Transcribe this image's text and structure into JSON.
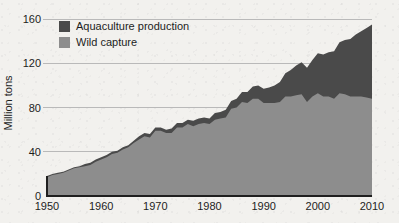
{
  "figure": {
    "background_color": "#f2f1ee",
    "plot_left_px": 47,
    "plot_right_px": 372,
    "plot_top_px": 8,
    "plot_baseline_px": 196
  },
  "legend": {
    "position": "top-left-inside",
    "entries": [
      {
        "label": "Aquaculture production",
        "color": "#4a4a4a"
      },
      {
        "label": "Wild capture",
        "color": "#8d8d8d"
      }
    ]
  },
  "axes": {
    "y_title": "Million tons",
    "y_ticks": [
      "0",
      "40",
      "80",
      "120",
      "160"
    ],
    "x_ticks": [
      "1950",
      "1960",
      "1970",
      "1980",
      "1990",
      "2000",
      "2010"
    ]
  },
  "chart_data": {
    "type": "area",
    "stacked": true,
    "title": "",
    "xlabel": "",
    "ylabel": "Million tons",
    "xlim": [
      1950,
      2010
    ],
    "ylim": [
      0,
      170
    ],
    "yticks": [
      0,
      40,
      80,
      120,
      160
    ],
    "xticks": [
      1950,
      1960,
      1970,
      1980,
      1990,
      2000,
      2010
    ],
    "grid": "horizontal",
    "legend_position": "upper left",
    "x": [
      1950,
      1951,
      1952,
      1953,
      1954,
      1955,
      1956,
      1957,
      1958,
      1959,
      1960,
      1961,
      1962,
      1963,
      1964,
      1965,
      1966,
      1967,
      1968,
      1969,
      1970,
      1971,
      1972,
      1973,
      1974,
      1975,
      1976,
      1977,
      1978,
      1979,
      1980,
      1981,
      1982,
      1983,
      1984,
      1985,
      1986,
      1987,
      1988,
      1989,
      1990,
      1991,
      1992,
      1993,
      1994,
      1995,
      1996,
      1997,
      1998,
      1999,
      2000,
      2001,
      2002,
      2003,
      2004,
      2005,
      2006,
      2007,
      2008,
      2009,
      2010
    ],
    "series": [
      {
        "name": "Wild capture",
        "color": "#8d8d8d",
        "values": [
          17,
          19,
          20,
          21,
          23,
          25,
          26,
          27,
          28,
          31,
          33,
          35,
          38,
          39,
          42,
          44,
          48,
          51,
          54,
          53,
          59,
          59,
          57,
          57,
          62,
          62,
          65,
          63,
          65,
          66,
          65,
          69,
          70,
          71,
          79,
          80,
          85,
          84,
          88,
          88,
          84,
          84,
          84,
          85,
          90,
          90,
          91,
          92,
          85,
          90,
          93,
          90,
          90,
          88,
          93,
          92,
          90,
          90,
          90,
          89,
          88
        ]
      },
      {
        "name": "Aquaculture production",
        "color": "#4a4a4a",
        "values": [
          1,
          1,
          1,
          1,
          1,
          1,
          1,
          2,
          2,
          2,
          2,
          2,
          2,
          2,
          2,
          2,
          2,
          3,
          3,
          3,
          3,
          3,
          3,
          4,
          4,
          4,
          4,
          5,
          5,
          5,
          5,
          6,
          6,
          7,
          7,
          8,
          9,
          10,
          11,
          12,
          13,
          14,
          16,
          18,
          21,
          24,
          27,
          29,
          31,
          33,
          36,
          38,
          40,
          43,
          46,
          49,
          52,
          56,
          59,
          63,
          67
        ]
      }
    ]
  }
}
